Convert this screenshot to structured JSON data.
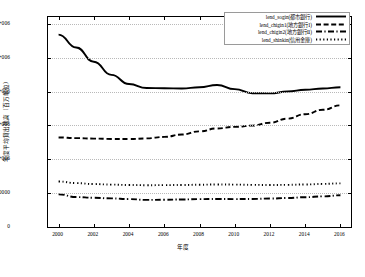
{
  "chart_data": {
    "type": "line",
    "title": "",
    "xlabel": "年度",
    "ylabel": "年度平均貸出残高（百万単位）",
    "xlim": [
      1999.4,
      2016.6
    ],
    "ylim": [
      0,
      3100000
    ],
    "grid": true,
    "legend_position": "top-right",
    "xticks": [
      "2000",
      "2002",
      "2004",
      "2006",
      "2008",
      "2010",
      "2012",
      "2014",
      "2016"
    ],
    "xtick_values": [
      2000,
      2002,
      2004,
      2006,
      2008,
      2010,
      2012,
      2014,
      2016
    ],
    "yticks": [
      "0",
      "500000",
      "1e+006",
      "1.5e+006",
      "2e+006",
      "2.5e+006",
      "3e+006"
    ],
    "ytick_values": [
      0,
      500000,
      1000000,
      1500000,
      2000000,
      2500000,
      3000000
    ],
    "x": [
      2000,
      2001,
      2002,
      2003,
      2004,
      2005,
      2006,
      2007,
      2008,
      2009,
      2010,
      2011,
      2012,
      2013,
      2014,
      2015,
      2016
    ],
    "series": [
      {
        "name": "lend_sogin(都市銀行)",
        "style": "solid",
        "values": [
          2840000,
          2650000,
          2440000,
          2245000,
          2110000,
          2052000,
          2048000,
          2044000,
          2062000,
          2097000,
          2035000,
          1975000,
          1972000,
          2000000,
          2025000,
          2045000,
          2062000
        ]
      },
      {
        "name": "lend_chigin1(地方銀行Ⅰ)",
        "style": "dashed",
        "values": [
          1322000,
          1312000,
          1305000,
          1300000,
          1298000,
          1308000,
          1330000,
          1365000,
          1412000,
          1455000,
          1478000,
          1497000,
          1540000,
          1600000,
          1665000,
          1730000,
          1795000
        ]
      },
      {
        "name": "lend_chigin2(地方銀行Ⅱ)",
        "style": "dashdot",
        "values": [
          482000,
          442000,
          432000,
          422000,
          412000,
          400000,
          402000,
          406000,
          412000,
          414000,
          412000,
          414000,
          420000,
          428000,
          440000,
          452000,
          468000
        ]
      },
      {
        "name": "lend_shinkin(信用金庫)",
        "style": "dotted",
        "values": [
          672000,
          648000,
          634000,
          626000,
          620000,
          617000,
          618000,
          620000,
          624000,
          628000,
          626000,
          622000,
          620000,
          622000,
          628000,
          636000,
          644000
        ]
      }
    ]
  }
}
